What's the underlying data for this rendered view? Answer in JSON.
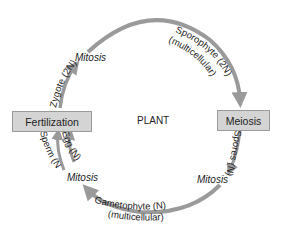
{
  "diagram": {
    "title": "PLANT",
    "nodes": {
      "fertilization": "Fertilization",
      "meiosis": "Meiosis"
    },
    "arcs": {
      "zygote": "Zygote (2N)",
      "sporophyte": "Sporophyte (2N)",
      "sporophyte_sub": "(multicellular)",
      "spores": "Spores (N)",
      "gametophyte": "Gametophyte (N)",
      "gametophyte_sub": "(multicellular)",
      "sperm": "Sperm (N)",
      "egg": "Egg (N)"
    },
    "processes": {
      "mitosis_top": "Mitosis",
      "mitosis_right": "Mitosis",
      "mitosis_left": "Mitosis"
    },
    "colors": {
      "arrow": "#9a9a9a",
      "box_fill": "#d4d4d4",
      "box_border": "#9a9a9a",
      "text": "#222222"
    }
  }
}
